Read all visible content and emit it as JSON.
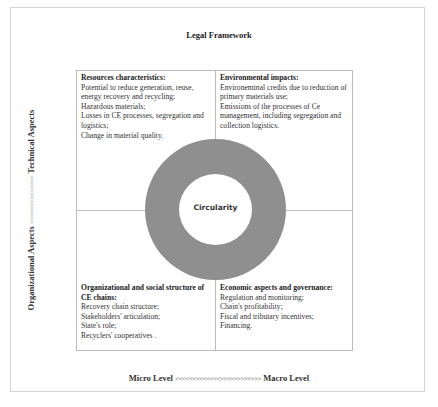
{
  "diagram": {
    "top_label": "Legal Framework",
    "side_label": {
      "left_text": "Organizational Aspects",
      "arrows": "<<<<<<<>>>>>>>",
      "right_text": "Technical Aspects"
    },
    "bottom_label": {
      "left_text": "Micro Level",
      "arrows": "<<<<<<<<<<<<<>>>>>>>>>>>>",
      "right_text": "Macro Level"
    },
    "center": {
      "label": "Circularity",
      "ring_color": "#8f8f8f"
    },
    "quadrants": {
      "top_left": {
        "title": "Resources characteristics:",
        "items": [
          "Potential to reduce generation, reuse, energy recovery and recycling;",
          "Hazardous materials;",
          "Losses in CE processes, segregation and logistics;",
          "Change in material quality."
        ]
      },
      "top_right": {
        "title": "Environmental impacts:",
        "items": [
          "Environemtnal credits due to reduction of primary materials use;",
          "Emissions of the processes of Ce management, including segregation and collection logistics."
        ]
      },
      "bottom_left": {
        "title": "Organizational and social structure of CE chains:",
        "items": [
          "Recovery chain structure;",
          "Stakeholders' articulation;",
          "State's role;",
          "Recyclers' cooperatives ."
        ]
      },
      "bottom_right": {
        "title": "Economic aspects and governance:",
        "items": [
          "Regulation and monitoring;",
          "Chain's profitability;",
          "Fiscal and tributary incentives;",
          "Financing."
        ]
      }
    }
  }
}
